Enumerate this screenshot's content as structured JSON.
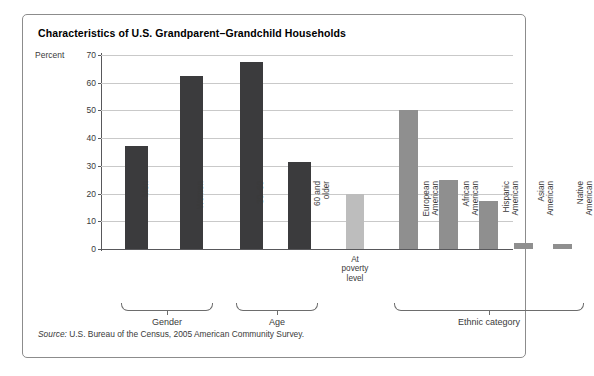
{
  "figure": {
    "title": "Characteristics of U.S. Grandparent–Grandchild Households",
    "source_prefix": "Source:",
    "source_text": " U.S. Bureau of the Census, 2005 American Community Survey."
  },
  "colors": {
    "bar_dark": "#3b3b3d",
    "bar_light": "#bdbdbd",
    "bar_medium": "#8f8f8f",
    "grid": "#c9c9c9",
    "axis": "#58585b",
    "border": "#8c8c8c",
    "text": "#3a3a3a"
  },
  "chart_data": {
    "type": "bar",
    "title": "Characteristics of U.S. Grandparent–Grandchild Households",
    "xlabel": "",
    "ylabel": "Percent",
    "ylim": [
      0,
      70
    ],
    "yticks": [
      0,
      10,
      20,
      30,
      40,
      50,
      60,
      70
    ],
    "grid": true,
    "legend": "none",
    "categories": [
      "Men",
      "Women",
      "30–60",
      "60 and older",
      "At poverty level",
      "European American",
      "African American",
      "Hispanic American",
      "Asian American",
      "Native American"
    ],
    "values": [
      37,
      62.5,
      67.5,
      31.5,
      20,
      50,
      25,
      17.5,
      2,
      1.7
    ],
    "bar_styles": [
      "dark",
      "dark",
      "dark",
      "dark",
      "light",
      "medium",
      "medium",
      "medium",
      "medium",
      "medium"
    ],
    "groups": [
      {
        "label": "Gender",
        "members": [
          "Men",
          "Women"
        ]
      },
      {
        "label": "Age",
        "members": [
          "30–60",
          "60 and older"
        ]
      },
      {
        "label": "",
        "members": [
          "At poverty level"
        ]
      },
      {
        "label": "Ethnic category",
        "members": [
          "European American",
          "African American",
          "Hispanic American",
          "Asian American",
          "Native American"
        ]
      }
    ]
  },
  "bars": [
    {
      "label_line1": "Men",
      "label_line2": "",
      "value": 37,
      "style": "dark",
      "rotated": true,
      "x": 24,
      "w": 23
    },
    {
      "label_line1": "Women",
      "label_line2": "",
      "value": 62.5,
      "style": "dark",
      "rotated": true,
      "x": 79,
      "w": 23
    },
    {
      "label_line1": "30–60",
      "label_line2": "",
      "value": 67.5,
      "style": "dark",
      "rotated": true,
      "x": 139,
      "w": 23
    },
    {
      "label_line1": "60 and",
      "label_line2": "older",
      "value": 31.5,
      "style": "dark",
      "rotated": true,
      "x": 187,
      "w": 23
    },
    {
      "label_line1": "At poverty",
      "label_line2": "level",
      "value": 20,
      "style": "light",
      "rotated": false,
      "x": 245,
      "w": 18
    },
    {
      "label_line1": "European",
      "label_line2": "American",
      "value": 50,
      "style": "medium",
      "rotated": true,
      "x": 298,
      "w": 19
    },
    {
      "label_line1": "African",
      "label_line2": "American",
      "value": 25,
      "style": "medium",
      "rotated": true,
      "x": 338,
      "w": 19
    },
    {
      "label_line1": "Hispanic",
      "label_line2": "American",
      "value": 17.5,
      "style": "medium",
      "rotated": true,
      "x": 378,
      "w": 19
    },
    {
      "label_line1": "Asian",
      "label_line2": "American",
      "value": 2,
      "style": "medium",
      "rotated": true,
      "x": 413,
      "w": 19
    },
    {
      "label_line1": "Native",
      "label_line2": "American",
      "value": 1.7,
      "style": "medium",
      "rotated": true,
      "x": 452,
      "w": 19
    }
  ],
  "yticks": [
    {
      "label": "70",
      "value": 70
    },
    {
      "label": "60",
      "value": 60
    },
    {
      "label": "50",
      "value": 50
    },
    {
      "label": "40",
      "value": 40
    },
    {
      "label": "30",
      "value": 30
    },
    {
      "label": "20",
      "value": 20
    },
    {
      "label": "10",
      "value": 10
    },
    {
      "label": "0",
      "value": 0
    }
  ],
  "axis": {
    "percent_label": "Percent"
  },
  "groups": [
    {
      "name": "Gender",
      "label": "Gender",
      "left": 20,
      "width": 92,
      "center": 66
    },
    {
      "name": "Age",
      "label": "Age",
      "left": 135,
      "width": 82,
      "center": 176
    },
    {
      "name": "Ethnic category",
      "label": "Ethnic category",
      "left": 293,
      "width": 190,
      "center": 388
    }
  ]
}
